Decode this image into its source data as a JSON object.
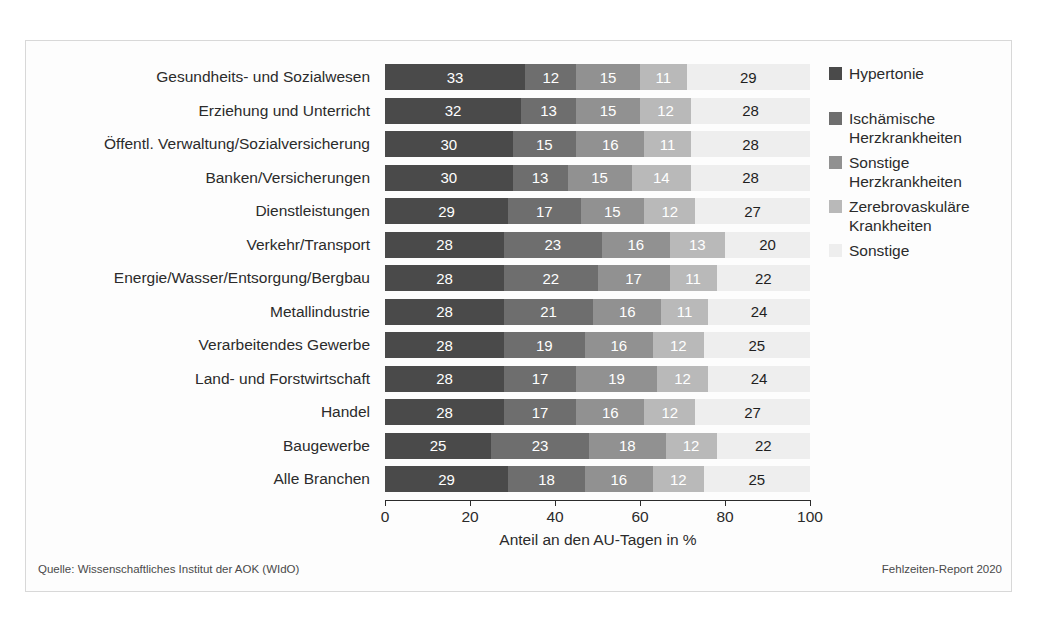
{
  "footer": {
    "source": "Quelle: Wissenschaftliches Institut der AOK (WIdO)",
    "report": "Fehlzeiten-Report 2020"
  },
  "colors": {
    "series": [
      "#4a4a4a",
      "#6e6e6e",
      "#919191",
      "#b9b9b9",
      "#eeeeee"
    ],
    "label_light": "#ffffff",
    "label_dark": "#1f1f1f",
    "axis": "#2b2b2b",
    "frame": "#d8d8d8",
    "background": "#fdfdfd"
  },
  "chart_data": {
    "type": "bar",
    "orientation": "horizontal",
    "stacked": true,
    "stack_mode": "percent",
    "title": "",
    "xlabel": "Anteil an den AU-Tagen in %",
    "ylabel": "",
    "xlim": [
      0,
      100
    ],
    "xticks": [
      0,
      20,
      40,
      60,
      80,
      100
    ],
    "xtick_labels": [
      "0",
      "20",
      "40",
      "60",
      "80",
      "100"
    ],
    "grid": false,
    "legend_position": "right",
    "legend": [
      "Hypertonie",
      "Ischämische Herzkrankheiten",
      "Sonstige Herzkrankheiten",
      "Zerebrovaskuläre Krankheiten",
      "Sonstige"
    ],
    "legend_lines": [
      [
        "Hypertonie"
      ],
      [
        "Ischämische",
        "Herzkrankheiten"
      ],
      [
        "Sonstige",
        "Herzkrankheiten"
      ],
      [
        "Zerebrovaskuläre",
        "Krankheiten"
      ],
      [
        "Sonstige"
      ]
    ],
    "categories": [
      "Gesundheits- und Sozialwesen",
      "Erziehung und Unterricht",
      "Öffentl. Verwaltung/Sozialversicherung",
      "Banken/Versicherungen",
      "Dienstleistungen",
      "Verkehr/Transport",
      "Energie/Wasser/Entsorgung/Bergbau",
      "Metallindustrie",
      "Verarbeitendes Gewerbe",
      "Land- und Forstwirtschaft",
      "Handel",
      "Baugewerbe",
      "Alle Branchen"
    ],
    "series": [
      {
        "name": "Hypertonie",
        "values": [
          33,
          32,
          30,
          30,
          29,
          28,
          28,
          28,
          28,
          28,
          28,
          25,
          29
        ]
      },
      {
        "name": "Ischämische Herzkrankheiten",
        "values": [
          12,
          13,
          15,
          13,
          17,
          23,
          22,
          21,
          19,
          17,
          17,
          23,
          18
        ]
      },
      {
        "name": "Sonstige Herzkrankheiten",
        "values": [
          15,
          15,
          16,
          15,
          15,
          16,
          17,
          16,
          16,
          19,
          16,
          18,
          16
        ]
      },
      {
        "name": "Zerebrovaskuläre Krankheiten",
        "values": [
          11,
          12,
          11,
          14,
          12,
          13,
          11,
          11,
          12,
          12,
          12,
          12,
          12
        ]
      },
      {
        "name": "Sonstige",
        "values": [
          29,
          28,
          28,
          28,
          27,
          20,
          22,
          24,
          25,
          24,
          27,
          22,
          25
        ]
      }
    ]
  }
}
